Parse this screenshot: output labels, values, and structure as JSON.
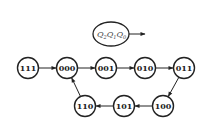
{
  "legend": {
    "label_parts": [
      {
        "var": "Q",
        "sub": "2"
      },
      {
        "var": "Q",
        "sub": "1"
      },
      {
        "var": "Q",
        "sub": "0"
      }
    ]
  },
  "states": [
    {
      "id": "111",
      "label": "111",
      "cx": 28,
      "cy": 68
    },
    {
      "id": "000",
      "label": "000",
      "cx": 67,
      "cy": 68
    },
    {
      "id": "001",
      "label": "001",
      "cx": 106,
      "cy": 68
    },
    {
      "id": "010",
      "label": "010",
      "cx": 145,
      "cy": 68
    },
    {
      "id": "011",
      "label": "011",
      "cx": 184,
      "cy": 68
    },
    {
      "id": "100",
      "label": "100",
      "cx": 163,
      "cy": 106
    },
    {
      "id": "101",
      "label": "101",
      "cx": 124,
      "cy": 106
    },
    {
      "id": "110",
      "label": "110",
      "cx": 85,
      "cy": 106
    }
  ],
  "transitions": [
    {
      "from": "111",
      "to": "000"
    },
    {
      "from": "000",
      "to": "001"
    },
    {
      "from": "001",
      "to": "010"
    },
    {
      "from": "010",
      "to": "011"
    },
    {
      "from": "011",
      "to": "100"
    },
    {
      "from": "100",
      "to": "101"
    },
    {
      "from": "101",
      "to": "110"
    },
    {
      "from": "110",
      "to": "000"
    }
  ],
  "colors": {
    "stroke": "#222222",
    "background": "#ffffff"
  }
}
